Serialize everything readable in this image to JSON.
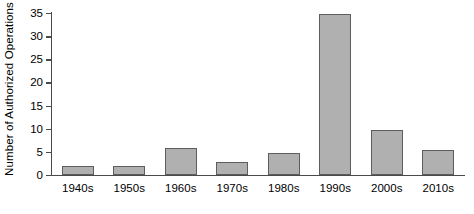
{
  "chart_data": {
    "type": "bar",
    "title": "",
    "xlabel": "",
    "ylabel": "Number of Authorized Operations",
    "categories": [
      "1940s",
      "1950s",
      "1960s",
      "1970s",
      "1980s",
      "1990s",
      "2000s",
      "2010s"
    ],
    "values": [
      2,
      2,
      5.8,
      2.9,
      4.8,
      34.8,
      9.7,
      5.5
    ],
    "ylim": [
      0,
      35
    ],
    "ytick_labels": [
      "0",
      "5",
      "10",
      "15",
      "20",
      "25",
      "30",
      "35"
    ],
    "ytick_values": [
      0,
      5,
      10,
      15,
      20,
      25,
      30,
      35
    ],
    "grid": false,
    "legend": null,
    "bar_fill_color": "#b0b0b0",
    "bar_edge_color": "#5d5d5d",
    "axis_color": "#4a4a4a",
    "background_color": "#ffffff"
  }
}
